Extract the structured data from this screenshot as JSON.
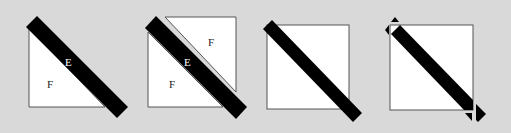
{
  "colors": {
    "background": "#d9d9d9",
    "square_fill": "#ffffff",
    "square_stroke": "#555555",
    "bar": "#000000",
    "label_dark": "#222222",
    "label_light": "#ffffff"
  },
  "panels": [
    {
      "id": "panel-1",
      "description": "Lower-left triangle with diagonal bar",
      "labels": [
        {
          "text": "E",
          "x": 69,
          "y": 66,
          "color": "light"
        },
        {
          "text": "F",
          "x": 50,
          "y": 88,
          "color": "dark"
        }
      ]
    },
    {
      "id": "panel-2",
      "description": "Square split into two triangles by diagonal bar with gap",
      "labels": [
        {
          "text": "F",
          "x": 211,
          "y": 46,
          "color": "dark"
        },
        {
          "text": "E",
          "x": 187,
          "y": 66,
          "color": "light"
        },
        {
          "text": "F",
          "x": 172,
          "y": 88,
          "color": "dark"
        }
      ]
    },
    {
      "id": "panel-3",
      "description": "Full square with diagonal bar overlapping",
      "labels": []
    },
    {
      "id": "panel-4",
      "description": "Full square with diagonal bar and corner markers",
      "labels": []
    }
  ]
}
